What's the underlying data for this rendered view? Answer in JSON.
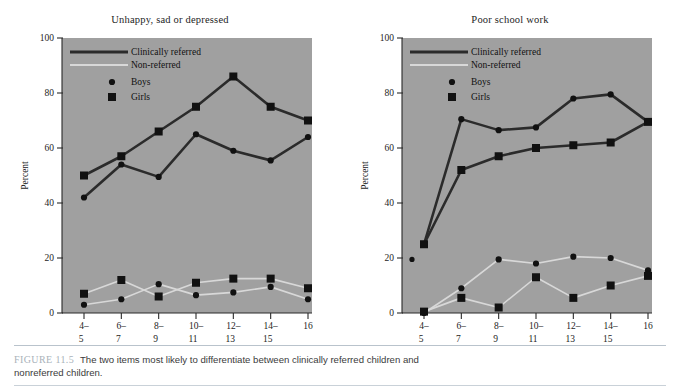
{
  "figure": {
    "caption_label": "FIGURE 11.5",
    "caption_text": "The two items most likely to differentiate between clinically referred children and nonreferred children.",
    "background": "#ffffff",
    "plot_background": "#a0a0a0"
  },
  "legend": {
    "clinically_referred": "Clinically referred",
    "non_referred": "Non-referred",
    "boys": "Boys",
    "girls": "Girls",
    "clinical_color": "#2b2b2b",
    "nonreferred_color": "#d8d8d8",
    "marker_color": "#111111"
  },
  "chart_data": [
    {
      "type": "line",
      "title": "Unhappy, sad or depressed",
      "xlabel": "Age",
      "ylabel": "Percent",
      "ylim": [
        0,
        100
      ],
      "yticks": [
        0,
        20,
        40,
        60,
        80,
        100
      ],
      "categories": [
        "4–5",
        "6–7",
        "8–9",
        "10–11",
        "12–13",
        "14–15",
        "16"
      ],
      "xtick_top": [
        "4–",
        "6–",
        "8–",
        "10–",
        "12–",
        "14–",
        "16"
      ],
      "xtick_bottom": [
        "5",
        "7",
        "9",
        "11",
        "13",
        "15",
        ""
      ],
      "grid": false,
      "legend_position": "top-left-inside",
      "series": [
        {
          "name": "Clinically referred – Girls",
          "group": "clinically-referred",
          "marker": "square",
          "values": [
            50,
            57,
            66,
            75,
            86,
            75,
            70
          ]
        },
        {
          "name": "Clinically referred – Boys",
          "group": "clinically-referred",
          "marker": "circle",
          "values": [
            42,
            54,
            49.5,
            65,
            59,
            55.5,
            64
          ]
        },
        {
          "name": "Non-referred – Girls",
          "group": "non-referred",
          "marker": "square",
          "values": [
            7,
            12,
            6,
            11,
            12.5,
            12.5,
            9
          ]
        },
        {
          "name": "Non-referred – Boys",
          "group": "non-referred",
          "marker": "circle",
          "values": [
            3,
            5,
            10.5,
            6.5,
            7.5,
            9.5,
            5
          ]
        }
      ]
    },
    {
      "type": "line",
      "title": "Poor school work",
      "xlabel": "Age",
      "ylabel": "Percent",
      "ylim": [
        0,
        100
      ],
      "yticks": [
        0,
        20,
        40,
        60,
        80,
        100
      ],
      "categories": [
        "4–5",
        "6–7",
        "8–9",
        "10–11",
        "12–13",
        "14–15",
        "16"
      ],
      "xtick_top": [
        "4–",
        "6–",
        "8–",
        "10–",
        "12–",
        "14–",
        "16"
      ],
      "xtick_bottom": [
        "5",
        "7",
        "9",
        "11",
        "13",
        "15",
        ""
      ],
      "grid": false,
      "legend_position": "top-left-inside",
      "series": [
        {
          "name": "Clinically referred – Boys",
          "group": "clinically-referred",
          "marker": "circle",
          "values": [
            25,
            70.5,
            66.5,
            67.5,
            78,
            79.5,
            69.5
          ]
        },
        {
          "name": "Clinically referred – Girls",
          "group": "clinically-referred",
          "marker": "square",
          "values": [
            25,
            52,
            57,
            60,
            61,
            62,
            69.5
          ]
        },
        {
          "name": "Non-referred – Boys",
          "group": "non-referred",
          "marker": "circle",
          "values": [
            0,
            9,
            19.5,
            18,
            20.5,
            20,
            15.5
          ]
        },
        {
          "name": "Non-referred – Girls",
          "group": "non-referred",
          "marker": "square",
          "values": [
            0.5,
            5.5,
            2,
            13,
            5.5,
            10,
            13.5
          ]
        }
      ],
      "stray_point": {
        "value": 19.5,
        "note": "isolated marker left of axis start"
      }
    }
  ]
}
